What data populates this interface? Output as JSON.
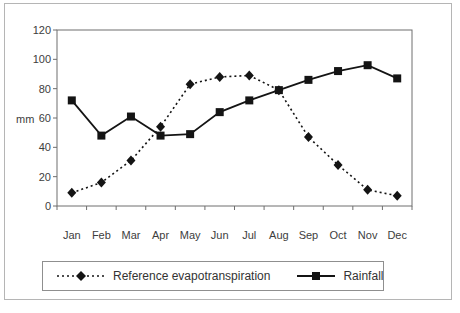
{
  "figure": {
    "background": "#ffffff",
    "frame_border_color": "#b5b5b5",
    "plot_border_color": "#6e6e6e",
    "series_color": "#141414",
    "text_color": "#3d3d3d"
  },
  "chart_data": {
    "type": "line",
    "title": "",
    "xlabel": "",
    "ylabel": "mm",
    "ylim": [
      0,
      120
    ],
    "y_ticks": [
      0,
      20,
      40,
      60,
      80,
      100,
      120
    ],
    "grid": false,
    "legend_position": "bottom",
    "categories": [
      "Jan",
      "Feb",
      "Mar",
      "Apr",
      "May",
      "Jun",
      "Jul",
      "Aug",
      "Sep",
      "Oct",
      "Nov",
      "Dec"
    ],
    "series": [
      {
        "name": "Reference evapotranspiration",
        "marker": "diamond",
        "line_style": "dotted",
        "color": "#141414",
        "values": [
          9,
          16,
          31,
          54,
          83,
          88,
          89,
          79,
          47,
          28,
          11,
          7
        ]
      },
      {
        "name": "Rainfall",
        "marker": "square",
        "line_style": "solid",
        "color": "#141414",
        "values": [
          72,
          48,
          61,
          48,
          49,
          64,
          72,
          79,
          86,
          92,
          96,
          87
        ]
      }
    ]
  }
}
